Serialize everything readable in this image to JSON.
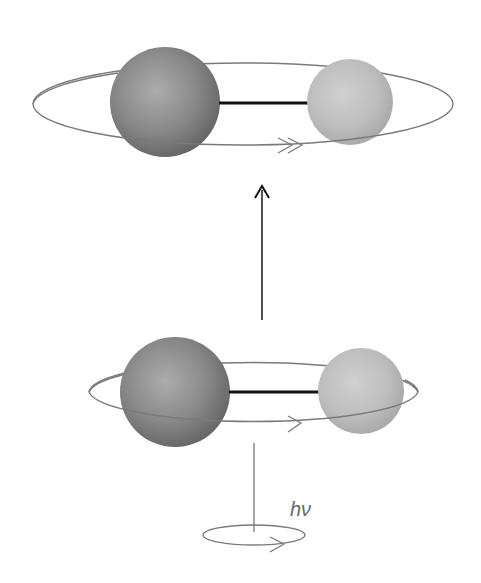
{
  "diagram": {
    "upper_state": {
      "name": "excited rotational state",
      "orbit_arrow": "double-chevron"
    },
    "lower_state": {
      "name": "ground rotational state",
      "orbit_arrow": "single-chevron"
    },
    "transition_arrow": "up-arrow",
    "photon": {
      "label": "hν",
      "spin_arrow": "single-chevron"
    },
    "colors": {
      "large_atom": "#7c7c7c",
      "large_atom_highlight": "#a8a8a8",
      "small_atom": "#b8b8b8",
      "small_atom_highlight": "#cfcfcf",
      "bond": "#111111",
      "orbit": "#7a7a7a",
      "arrow": "#222222"
    }
  }
}
